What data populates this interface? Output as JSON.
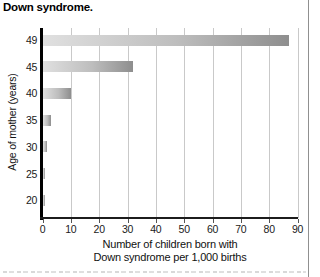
{
  "page": {
    "title": "Down syndrome."
  },
  "chart_data": {
    "type": "bar",
    "orientation": "horizontal",
    "title": "Down syndrome.",
    "ylabel": "Age of mother (years)",
    "xlabel_lines": [
      "Number of children born with",
      "Down syndrome per 1,000 births"
    ],
    "categories": [
      "49",
      "45",
      "40",
      "35",
      "30",
      "25",
      "20"
    ],
    "values": [
      87,
      32,
      10,
      3,
      1.5,
      1,
      0.8
    ],
    "xlim": [
      0,
      90
    ],
    "xticks": [
      0,
      10,
      20,
      30,
      40,
      50,
      60,
      70,
      80,
      90
    ],
    "grid": "vertical-gridlines-on",
    "legend": "none",
    "bar_gradient_left": "#e0e0e0",
    "bar_gradient_right": "#8e8e8e",
    "gridline_color": "#c9c9c9",
    "axis_color": "#000000"
  },
  "decorations": {
    "page_rule_color": "#909090"
  }
}
